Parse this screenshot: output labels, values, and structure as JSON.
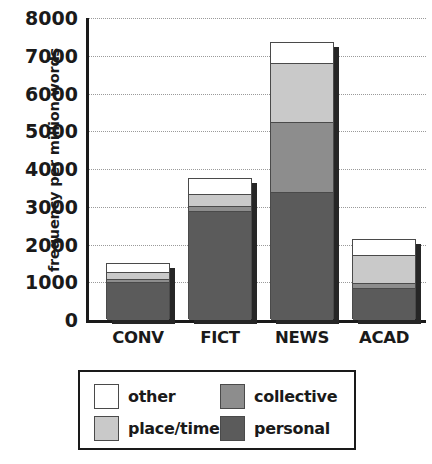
{
  "chart_data": {
    "type": "bar",
    "subtype": "stacked-bar",
    "title": "",
    "xlabel": "",
    "ylabel": "frequency per million words",
    "categories": [
      "CONV",
      "FICT",
      "NEWS",
      "ACAD"
    ],
    "ylim": [
      0,
      8000
    ],
    "yticks": [
      0,
      1000,
      2000,
      3000,
      4000,
      5000,
      6000,
      7000,
      8000
    ],
    "ytick_labels": [
      "0",
      "1000",
      "2000",
      "3000",
      "4000",
      "5000",
      "6000",
      "7000",
      "8000"
    ],
    "grid": true,
    "grid_axis": "y",
    "grid_style": "dotted",
    "legend_position": "bottom",
    "stack_order_bottom_to_top": [
      "personal",
      "collective",
      "place/time",
      "other"
    ],
    "series": [
      {
        "name": "personal",
        "color": "#5b5b5b",
        "values": [
          1000,
          2900,
          3400,
          850
        ]
      },
      {
        "name": "collective",
        "color": "#8d8d8d",
        "values": [
          80,
          130,
          1850,
          130
        ]
      },
      {
        "name": "place/time",
        "color": "#c9c9c9",
        "values": [
          200,
          300,
          1550,
          750
        ]
      },
      {
        "name": "other",
        "color": "#ffffff",
        "values": [
          200,
          400,
          550,
          400
        ]
      }
    ],
    "totals": [
      1480,
      3730,
      7350,
      2130
    ],
    "legend_entries": [
      {
        "label": "other",
        "color": "#ffffff"
      },
      {
        "label": "collective",
        "color": "#8d8d8d"
      },
      {
        "label": "place/time",
        "color": "#c9c9c9"
      },
      {
        "label": "personal",
        "color": "#5b5b5b"
      }
    ]
  }
}
